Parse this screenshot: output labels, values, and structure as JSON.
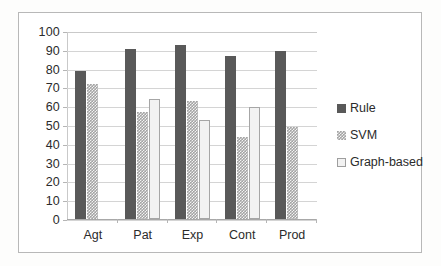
{
  "chart_data": {
    "type": "bar",
    "title": "",
    "subtitle": "",
    "xlabel": "",
    "ylabel": "",
    "ylim": [
      0,
      100
    ],
    "ytick_step": 10,
    "yticks": [
      "100",
      "90",
      "80",
      "70",
      "60",
      "50",
      "40",
      "30",
      "20",
      "10",
      "0"
    ],
    "grid": true,
    "legend_position": "right",
    "categories": [
      "Agt",
      "Pat",
      "Exp",
      "Cont",
      "Prod"
    ],
    "series": [
      {
        "name": "Rule",
        "swatch": "rule",
        "color": "#595959",
        "values": [
          79,
          91,
          93,
          87,
          90
        ]
      },
      {
        "name": "SVM",
        "swatch": "svm",
        "color": "#a3a3a3",
        "values": [
          72,
          57,
          63,
          44,
          49
        ]
      },
      {
        "name": "Graph-based",
        "swatch": "graph",
        "color": "#f2f2f2",
        "values": [
          null,
          64,
          53,
          60,
          null
        ]
      }
    ]
  },
  "legend": {
    "items": [
      {
        "label": "Rule"
      },
      {
        "label": "SVM"
      },
      {
        "label": "Graph-based"
      }
    ]
  }
}
